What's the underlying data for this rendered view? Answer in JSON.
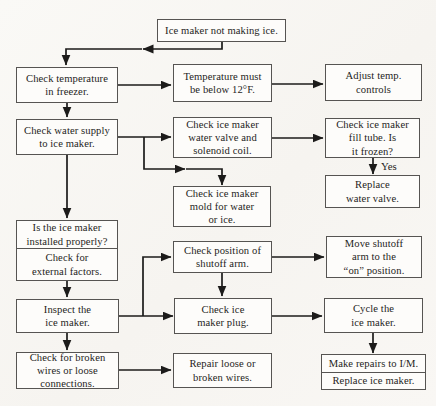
{
  "diagram": {
    "kind": "troubleshooting-flowchart",
    "nodes": {
      "start": "Ice maker not making ice.",
      "check_temp": "Check temperature\nin freezer.",
      "temp_must": "Temperature must\nbe below 12°F.",
      "adjust_temp": "Adjust temp.\ncontrols",
      "water_supply": "Check water supply\nto ice maker.",
      "valve_coil": "Check ice maker\nwater valve and\nsolenoid coil.",
      "fill_tube": "Check ice maker\nfill tube. Is\nit frozen?",
      "replace_valve": "Replace\nwater valve.",
      "mold": "Check ice maker\nmold for water\nor ice.",
      "installed_q": "Is the ice maker\ninstalled properly?",
      "external_factors": "Check for\nexternal factors.",
      "shutoff_position": "Check position of\nshutoff arm.",
      "move_shutoff": "Move shutoff\narm to the\n“on” position.",
      "inspect": "Inspect the\nice maker.",
      "plug": "Check ice\nmaker plug.",
      "cycle": "Cycle the\nice maker.",
      "broken_wires": "Check for broken\nwires or loose\nconnections.",
      "repair_wires": "Repair loose or\nbroken wires.",
      "make_repairs": "Make repairs to I/M.",
      "replace_maker": "Replace ice maker."
    },
    "edge_labels": {
      "yes": "Yes"
    },
    "colors": {
      "line": "#1c1b1a",
      "box_border": "#565452",
      "box_background": "#fdfcfa",
      "text": "#1f1e1c",
      "page_background": "#f8f6f3"
    }
  }
}
